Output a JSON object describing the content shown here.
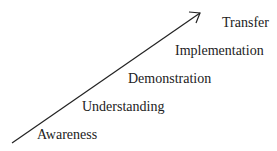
{
  "diagram": {
    "type": "progression-arrow",
    "arrow_color": "#222222",
    "text_color": "#222222",
    "stages": [
      {
        "label": "Awareness"
      },
      {
        "label": "Understanding"
      },
      {
        "label": "Demonstration"
      },
      {
        "label": "Implementation"
      },
      {
        "label": "Transfer"
      }
    ]
  }
}
